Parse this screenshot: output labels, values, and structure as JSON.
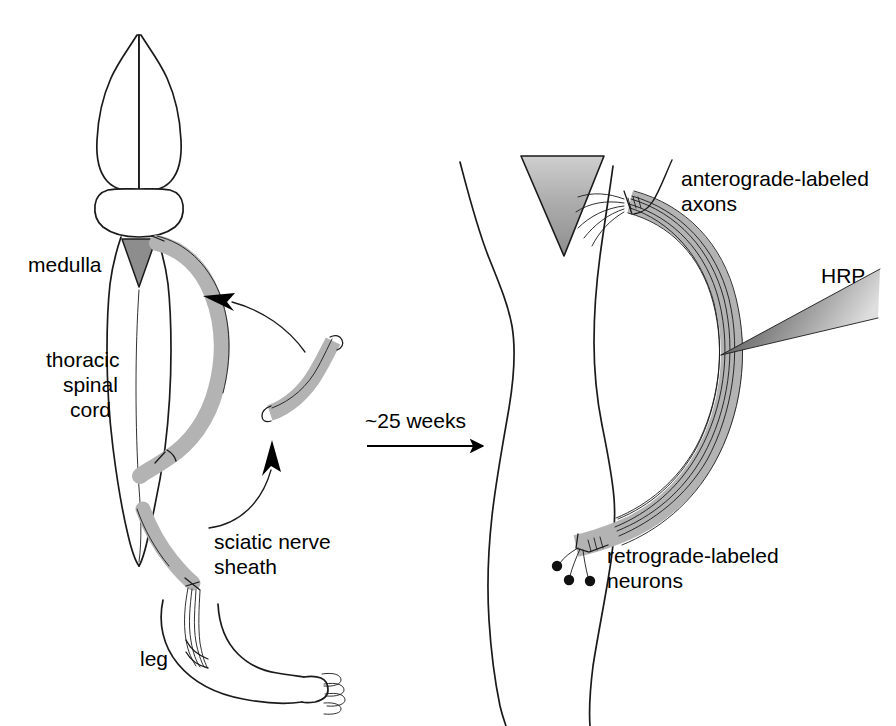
{
  "figure": {
    "background_color": "#ffffff",
    "ink_color": "#1a1a1a",
    "sheath_gray": "#b3b3b3",
    "medulla_gray": "#8a8a8a",
    "pipette_gray": "#7d7d7d"
  },
  "left_panel": {
    "name": "donor-and-host-overview",
    "labels": {
      "medulla": "medulla",
      "thoracic_spinal_cord_line1": "thoracic",
      "thoracic_spinal_cord_line2": "spinal",
      "thoracic_spinal_cord_line3": "cord",
      "sciatic_nerve_sheath_line1": "sciatic nerve",
      "sciatic_nerve_sheath_line2": "sheath",
      "leg": "leg"
    }
  },
  "transition": {
    "name": "time-arrow",
    "duration_label": "~25 weeks"
  },
  "right_panel": {
    "name": "labeled-graft-detail",
    "labels": {
      "anterograde_line1": "anterograde-labeled",
      "anterograde_line2": "axons",
      "hrp": "HRP",
      "retrograde_line1": "retrograde-labeled",
      "retrograde_line2": "neurons"
    }
  }
}
